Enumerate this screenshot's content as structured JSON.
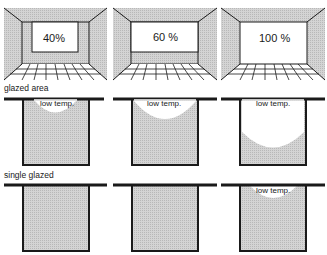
{
  "colors": {
    "stipple": "#c8c8c8",
    "wall": "#cfcfcf",
    "line": "#1a1a1a",
    "window": "#ffffff"
  },
  "rooms": [
    {
      "label": "40%",
      "window_ratio": 0.4
    },
    {
      "label": "60 %",
      "window_ratio": 0.6
    },
    {
      "label": "100 %",
      "window_ratio": 1.0
    }
  ],
  "sections": [
    {
      "title": "glazed area",
      "panels": [
        {
          "note": "low temp.",
          "cold_zone": "small"
        },
        {
          "note": "low temp.",
          "cold_zone": "medium"
        },
        {
          "note": "low temp.",
          "cold_zone": "large"
        }
      ]
    },
    {
      "title": "single glazed",
      "panels": [
        {
          "note": "",
          "cold_zone": "none"
        },
        {
          "note": "",
          "cold_zone": "none"
        },
        {
          "note": "low temp.",
          "cold_zone": "small"
        }
      ]
    }
  ]
}
